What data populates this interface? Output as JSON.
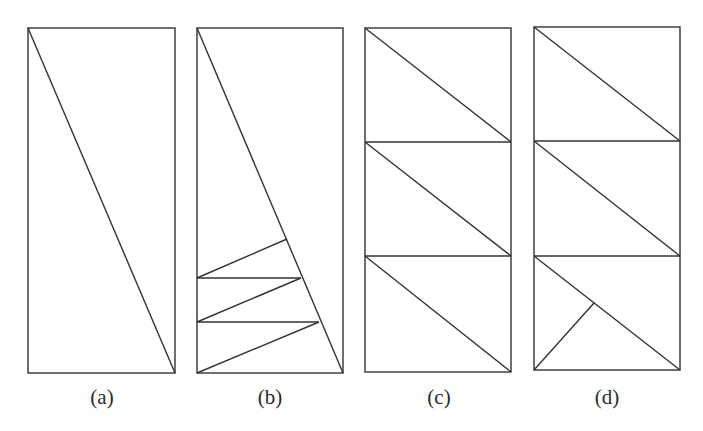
{
  "figure": {
    "stroke_color": "#333333",
    "background": "#ffffff",
    "panels": [
      {
        "id": "a",
        "label": "(a)",
        "rect": {
          "x": 28,
          "y": 28,
          "w": 147,
          "h": 345
        },
        "lines": [
          [
            28,
            28,
            175,
            373
          ]
        ]
      },
      {
        "id": "b",
        "label": "(b)",
        "rect": {
          "x": 197,
          "y": 28,
          "w": 146,
          "h": 345
        },
        "lines": [
          [
            197,
            28,
            343,
            373
          ],
          [
            287,
            239,
            197,
            278
          ],
          [
            197,
            278,
            301,
            278
          ],
          [
            301,
            278,
            197,
            322
          ],
          [
            197,
            322,
            319,
            322
          ],
          [
            319,
            322,
            197,
            373
          ]
        ]
      },
      {
        "id": "c",
        "label": "(c)",
        "rect": {
          "x": 365,
          "y": 28,
          "w": 146,
          "h": 344
        },
        "lines": [
          [
            365,
            142,
            511,
            142
          ],
          [
            365,
            256,
            511,
            256
          ],
          [
            365,
            28,
            511,
            142
          ],
          [
            365,
            142,
            511,
            256
          ],
          [
            365,
            256,
            511,
            372
          ]
        ]
      },
      {
        "id": "d",
        "label": "(d)",
        "rect": {
          "x": 534,
          "y": 27,
          "w": 146,
          "h": 343
        },
        "lines": [
          [
            534,
            141,
            680,
            141
          ],
          [
            534,
            256,
            680,
            256
          ],
          [
            534,
            27,
            680,
            141
          ],
          [
            534,
            141,
            680,
            256
          ],
          [
            534,
            256,
            680,
            370
          ],
          [
            534,
            370,
            594,
            303
          ]
        ]
      }
    ],
    "labels": {
      "a": "(a)",
      "b": "(b)",
      "c": "(c)",
      "d": "(d)"
    }
  }
}
